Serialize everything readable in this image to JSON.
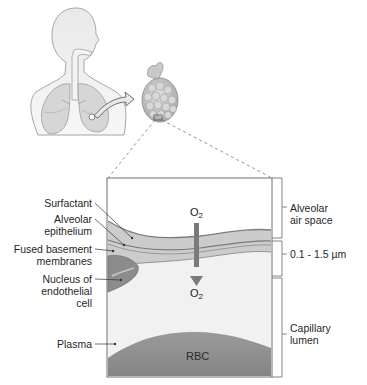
{
  "figure": {
    "overview": {
      "human_torso": "human-respiratory-system",
      "alveolus": "alveolar-sac",
      "arrow": "zoom-arrow"
    },
    "labels_left": [
      {
        "id": "surfactant",
        "lines": [
          "Surfactant"
        ]
      },
      {
        "id": "alveolar_epithelium",
        "lines": [
          "Alveolar",
          "epithelium"
        ]
      },
      {
        "id": "fused_basement",
        "lines": [
          "Fused basement",
          "membranes"
        ]
      },
      {
        "id": "nucleus",
        "lines": [
          "Nucleus of",
          "endothelial",
          "cell"
        ]
      },
      {
        "id": "plasma",
        "lines": [
          "Plasma"
        ]
      }
    ],
    "labels_right": [
      {
        "id": "air_space",
        "lines": [
          "Alveolar",
          "air space"
        ]
      },
      {
        "id": "thickness",
        "lines": [
          "0.1 - 1.5 µm"
        ]
      },
      {
        "id": "capillary",
        "lines": [
          "Capillary",
          "lumen"
        ]
      }
    ],
    "oxygen_top": {
      "base": "O",
      "sub": "2"
    },
    "oxygen_bottom": {
      "base": "O",
      "sub": "2"
    },
    "rbc_label": "RBC",
    "colors": {
      "body_fill": "#e6e6e6",
      "body_stroke": "#9a9a9a",
      "membrane_light": "#c9c9c9",
      "membrane_dark": "#8a8a8a",
      "plasma": "#f1f1f1",
      "rbc": "#8f8f8f",
      "arrow": "#7a7a7a",
      "box_border": "#6e6e6e"
    }
  }
}
